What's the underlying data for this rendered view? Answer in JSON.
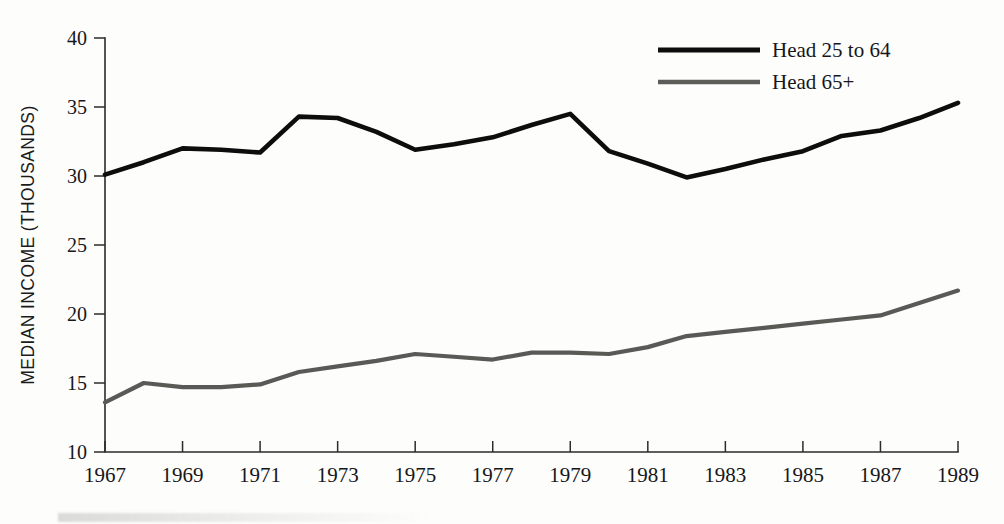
{
  "chart_data": {
    "type": "line",
    "title": "",
    "xlabel": "",
    "ylabel": "MEDIAN INCOME (THOUSANDS)",
    "xlim": [
      1967,
      1989
    ],
    "ylim": [
      10,
      40
    ],
    "ytick_values": [
      10,
      15,
      20,
      25,
      30,
      35,
      40
    ],
    "ytick_labels": [
      "10",
      "15",
      "20",
      "25",
      "30",
      "35",
      "40"
    ],
    "xtick_values": [
      1967,
      1969,
      1971,
      1973,
      1975,
      1977,
      1979,
      1981,
      1983,
      1985,
      1987,
      1989
    ],
    "xtick_labels": [
      "1967",
      "1969",
      "1971",
      "1973",
      "1975",
      "1977",
      "1979",
      "1981",
      "1983",
      "1985",
      "1987",
      "1989"
    ],
    "grid": false,
    "legend_position": "top-right",
    "x": [
      1967,
      1968,
      1969,
      1970,
      1971,
      1972,
      1973,
      1974,
      1975,
      1976,
      1977,
      1978,
      1979,
      1980,
      1981,
      1982,
      1983,
      1984,
      1985,
      1986,
      1987,
      1988,
      1989
    ],
    "series": [
      {
        "name": "Head 25 to 64",
        "color": "#0d0d0d",
        "values": [
          30.1,
          31.0,
          32.0,
          31.9,
          31.7,
          34.3,
          34.2,
          33.2,
          31.9,
          32.3,
          32.8,
          33.7,
          34.5,
          31.8,
          30.9,
          29.9,
          30.5,
          31.2,
          31.8,
          32.9,
          33.3,
          34.2,
          35.3
        ]
      },
      {
        "name": "Head 65+",
        "color": "#595955",
        "values": [
          13.6,
          15.0,
          14.7,
          14.7,
          14.9,
          15.8,
          16.2,
          16.6,
          17.1,
          16.9,
          16.7,
          17.2,
          17.2,
          17.1,
          17.6,
          18.4,
          18.7,
          19.0,
          19.3,
          19.6,
          19.9,
          20.8,
          21.7
        ]
      }
    ]
  },
  "legend": {
    "items": [
      {
        "label": "Head 25 to 64",
        "color": "#0d0d0d",
        "style": "solid-thick"
      },
      {
        "label": "Head 65+",
        "color": "#5c5c58",
        "style": "solid-gray"
      }
    ]
  },
  "axis": {
    "y_title": "MEDIAN INCOME (THOUSANDS)"
  }
}
